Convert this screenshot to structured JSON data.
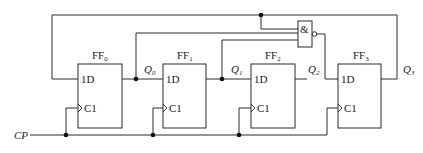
{
  "diagram": {
    "type": "circuit-schematic",
    "title": "",
    "clock_label": "CP",
    "flip_flops": [
      {
        "name": "FF",
        "sub": "0",
        "d_label": "1D",
        "c_label": "C1",
        "output": "Q",
        "output_sub": "0"
      },
      {
        "name": "FF",
        "sub": "1",
        "d_label": "1D",
        "c_label": "C1",
        "output": "Q",
        "output_sub": "1"
      },
      {
        "name": "FF",
        "sub": "2",
        "d_label": "1D",
        "c_label": "C1",
        "output": "Q",
        "output_sub": "2"
      },
      {
        "name": "FF",
        "sub": "3",
        "d_label": "1D",
        "c_label": "C1",
        "output": "Q",
        "output_sub": "3"
      }
    ],
    "gate": {
      "type": "NAND",
      "symbol": "&",
      "inputs": [
        "Q0",
        "Q1",
        "Q3"
      ],
      "output_to": "FF3.1D"
    },
    "feedback": "Q3 to FF0.1D"
  }
}
